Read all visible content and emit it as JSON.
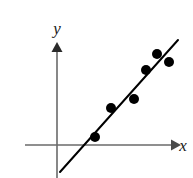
{
  "figure": {
    "kind": "scatter-with-trendline",
    "background_color": "#ffffff",
    "axis_color": "#6a6a6a",
    "data_color": "#000000",
    "trendline_color": "#000000"
  },
  "labels": {
    "x_axis": "x",
    "y_axis": "y"
  },
  "chart_data": {
    "type": "scatter",
    "title": "",
    "subtitle": "",
    "xlabel": "x",
    "ylabel": "y",
    "grid": false,
    "legend": null,
    "legend_position": "none",
    "xlim": [
      0,
      10
    ],
    "ylim": [
      -2,
      8
    ],
    "axis_ticks": false,
    "tick_labels_x": [],
    "tick_labels_y": [],
    "origin_px": {
      "x": 57,
      "y": 145
    },
    "x_axis_px": {
      "x1": 25,
      "x2": 175,
      "y": 145,
      "arrow_end": "right"
    },
    "y_axis_px": {
      "x": 57,
      "y1": 44,
      "y2": 178,
      "arrow_end": "top"
    },
    "points_px": [
      {
        "x": 95,
        "y": 137
      },
      {
        "x": 111,
        "y": 108
      },
      {
        "x": 134,
        "y": 99
      },
      {
        "x": 146,
        "y": 70
      },
      {
        "x": 169,
        "y": 62
      }
    ],
    "points": [
      {
        "x": 2.5,
        "y": 0.55
      },
      {
        "x": 3.6,
        "y": 2.5
      },
      {
        "x": 5.1,
        "y": 3.1
      },
      {
        "x": 5.9,
        "y": 5.0
      },
      {
        "x": 7.4,
        "y": 5.6
      }
    ],
    "extra_point_px": {
      "x": 157,
      "y": 54
    },
    "extra_point": {
      "x": 6.7,
      "y": 6.1
    },
    "point_radius_px": 5,
    "trendline_px": {
      "x1": 60,
      "y1": 172,
      "x2": 178,
      "y2": 40
    },
    "trendline": {
      "slope": 1.12,
      "intercept": -2.35,
      "x_intercept": 2.1
    },
    "trendline_width_px": 2,
    "annotations": []
  }
}
